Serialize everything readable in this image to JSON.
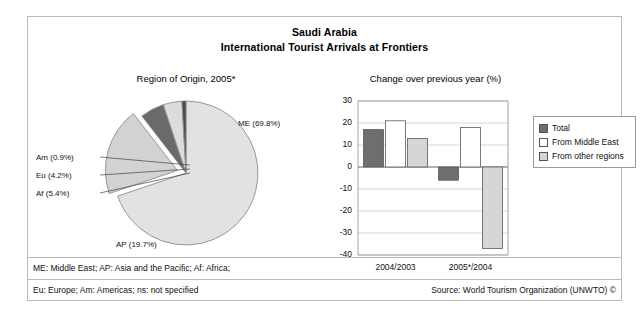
{
  "header": {
    "line1": "Saudi Arabia",
    "line2": "International Tourist Arrivals at Frontiers"
  },
  "pie_panel": {
    "caption": "Region of Origin, 2005*"
  },
  "bar_panel": {
    "caption": "Change over previous year (%)"
  },
  "legend": {
    "items": [
      {
        "label": "Total",
        "color": "#6e6e6e"
      },
      {
        "label": "From Middle East",
        "color": "#ffffff"
      },
      {
        "label": "From other regions",
        "color": "#d6d6d6"
      }
    ]
  },
  "footer": {
    "note1": "ME: Middle East; AP: Asia and the Pacific; Af: Africa;",
    "note2": "Eu: Europe; Am: Americas; ns: not specified",
    "source": "Source: World Tourism Organization (UNWTO) ©"
  },
  "chart_data": [
    {
      "type": "pie",
      "title": "Region of Origin, 2005*",
      "categories": [
        "ME",
        "AP",
        "Af",
        "Eu",
        "Am"
      ],
      "values": [
        69.8,
        19.7,
        5.4,
        4.2,
        0.9
      ],
      "labels": [
        "ME (69.8%)",
        "AP (19.7%)",
        "Af (5.4%)",
        "Eu (4.2%)",
        "Am (0.9%)"
      ],
      "colors": [
        "#e2e2e2",
        "#d2d2d2",
        "#6a6a6a",
        "#dcdcdc",
        "#4a4a4a"
      ],
      "exploded": [
        "AP"
      ],
      "units": "percent"
    },
    {
      "type": "bar",
      "title": "Change over previous year (%)",
      "categories": [
        "2004/2003",
        "2005*/2004"
      ],
      "series": [
        {
          "name": "Total",
          "values": [
            17,
            -6
          ],
          "color": "#6e6e6e"
        },
        {
          "name": "From Middle East",
          "values": [
            21,
            18
          ],
          "color": "#ffffff"
        },
        {
          "name": "From other regions",
          "values": [
            13,
            -37
          ],
          "color": "#d6d6d6"
        }
      ],
      "ylabel": "",
      "xlabel": "",
      "ylim": [
        -40,
        30
      ],
      "yticks": [
        30,
        20,
        10,
        0,
        -10,
        -20,
        -30,
        -40
      ],
      "grid": true,
      "legend_position": "right"
    }
  ]
}
